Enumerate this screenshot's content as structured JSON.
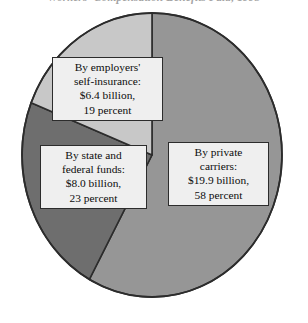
{
  "chart": {
    "title": "Workers' Compensation Benefits Paid, 1993",
    "title_note": "cropped at top edge of image"
  },
  "chart_data": {
    "type": "pie",
    "title": "Workers' Compensation Benefits Paid, 1993",
    "xlabel": "",
    "ylabel": "",
    "unit": "billions of dollars",
    "legend": "none",
    "grid": false,
    "start_angle_deg": 0,
    "direction": "clockwise",
    "categories": [
      "By private carriers",
      "By state and federal funds",
      "By employers' self-insurance"
    ],
    "values": [
      19.9,
      8.0,
      6.4
    ],
    "percents": [
      58,
      23,
      19
    ],
    "colors": [
      "#969696",
      "#6e6e6e",
      "#c8c8c8"
    ],
    "total_value": 34.3,
    "slices": [
      {
        "name": "By private carriers",
        "value": 19.9,
        "percent": 58,
        "color": "#969696",
        "label_lines": [
          "By private",
          "carriers:",
          "$19.9 billion,",
          "58 percent"
        ]
      },
      {
        "name": "By state and federal funds",
        "value": 8.0,
        "percent": 23,
        "color": "#6e6e6e",
        "label_lines": [
          "By state and",
          "federal funds:",
          "$8.0 billion,",
          "23 percent"
        ]
      },
      {
        "name": "By employers' self-insurance",
        "value": 6.4,
        "percent": 19,
        "color": "#c8c8c8",
        "label_lines": [
          "By employers'",
          "self-insurance:",
          "$6.4 billion,",
          "19 percent"
        ]
      }
    ]
  },
  "callouts": {
    "employers": {
      "line1": "By employers'",
      "line2": "self-insurance:",
      "line3": "$6.4 billion,",
      "line4": "19 percent"
    },
    "state": {
      "line1": "By state and",
      "line2": "federal funds:",
      "line3": "$8.0 billion,",
      "line4": "23 percent"
    },
    "private": {
      "line1": "By private",
      "line2": "carriers:",
      "line3": "$19.9 billion,",
      "line4": "58 percent"
    }
  },
  "style": {
    "background": "#ffffff",
    "outline": "#2c2c2c",
    "label_fill": "#efefef"
  }
}
